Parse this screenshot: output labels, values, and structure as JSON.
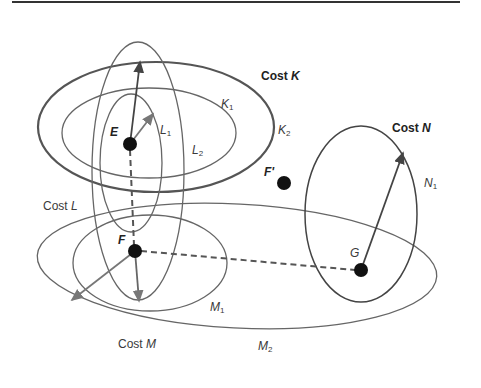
{
  "figure": {
    "nodes": [
      {
        "id": "E",
        "label": "E",
        "x": 130,
        "y": 144
      },
      {
        "id": "F",
        "label": "F",
        "x": 135,
        "y": 251
      },
      {
        "id": "F_prime",
        "label": "F'",
        "x": 284,
        "y": 183
      },
      {
        "id": "G",
        "label": "G",
        "x": 361,
        "y": 270
      }
    ],
    "cost_labels": {
      "K": {
        "prefix": "Cost ",
        "var": "K"
      },
      "L": {
        "prefix": "Cost ",
        "var": "L"
      },
      "M": {
        "prefix": "Cost ",
        "var": "M"
      },
      "N": {
        "prefix": "Cost ",
        "var": "N"
      }
    },
    "contour_labels": {
      "K1": {
        "letter": "K",
        "sub": "1"
      },
      "K2": {
        "letter": "K",
        "sub": "2"
      },
      "L1": {
        "letter": "L",
        "sub": "1"
      },
      "L2": {
        "letter": "L",
        "sub": "2"
      },
      "M1": {
        "letter": "M",
        "sub": "1"
      },
      "M2": {
        "letter": "M",
        "sub": "2"
      },
      "N1": {
        "letter": "N",
        "sub": "1"
      }
    },
    "ellipses": [
      {
        "id": "K2",
        "cx": 156,
        "cy": 127,
        "rx": 118,
        "ry": 65,
        "rotate": 0,
        "stroke": "#555555",
        "width": 2.2
      },
      {
        "id": "K1",
        "cx": 149,
        "cy": 133,
        "rx": 87,
        "ry": 45,
        "rotate": 0,
        "stroke": "#666666",
        "width": 1.3
      },
      {
        "id": "L2",
        "cx": 138,
        "cy": 171,
        "rx": 46,
        "ry": 129,
        "rotate": 0,
        "stroke": "#666666",
        "width": 1.3
      },
      {
        "id": "L1",
        "cx": 131,
        "cy": 163,
        "rx": 31,
        "ry": 69,
        "rotate": 0,
        "stroke": "#666666",
        "width": 1.3
      },
      {
        "id": "M1",
        "cx": 150,
        "cy": 263,
        "rx": 77,
        "ry": 48,
        "rotate": 0,
        "stroke": "#666666",
        "width": 1.3
      },
      {
        "id": "M2",
        "cx": 237,
        "cy": 266,
        "rx": 200,
        "ry": 62,
        "rotate": 3,
        "stroke": "#666666",
        "width": 1.3
      },
      {
        "id": "N1",
        "cx": 361,
        "cy": 214,
        "rx": 56,
        "ry": 88,
        "rotate": 0,
        "stroke": "#444444",
        "width": 1.5
      }
    ],
    "arrows": [
      {
        "from": "E",
        "x1": 130,
        "y1": 144,
        "x2": 140,
        "y2": 62,
        "stroke": "#444444"
      },
      {
        "from": "E",
        "x1": 130,
        "y1": 144,
        "x2": 153,
        "y2": 114,
        "stroke": "#777777"
      },
      {
        "from": "F",
        "x1": 135,
        "y1": 251,
        "x2": 139,
        "y2": 301,
        "stroke": "#666666"
      },
      {
        "from": "F",
        "x1": 135,
        "y1": 251,
        "x2": 72,
        "y2": 300,
        "stroke": "#777777"
      },
      {
        "from": "G",
        "x1": 361,
        "y1": 270,
        "x2": 403,
        "y2": 153,
        "stroke": "#444444"
      }
    ],
    "dashed_links": [
      {
        "from": "E",
        "to": "F",
        "x1": 130,
        "y1": 150,
        "x2": 134,
        "y2": 245
      },
      {
        "from": "F",
        "to": "G",
        "x1": 141,
        "y1": 251,
        "x2": 355,
        "y2": 270
      }
    ],
    "colors": {
      "node_fill": "#111111",
      "dash_stroke": "#555555",
      "top_rule": "#333333"
    }
  }
}
